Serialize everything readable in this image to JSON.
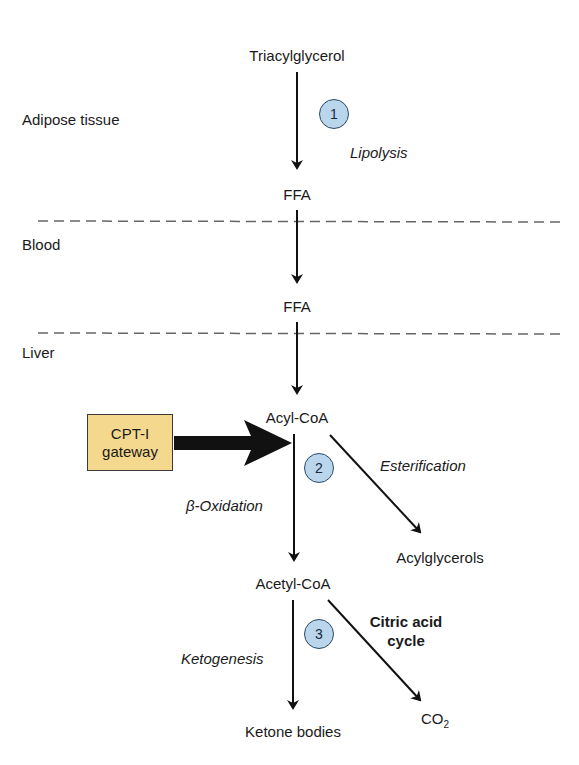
{
  "regions": {
    "adipose": "Adipose tissue",
    "blood": "Blood",
    "liver": "Liver"
  },
  "nodes": {
    "triacylglycerol": "Triacylglycerol",
    "ffa_adipose": "FFA",
    "ffa_blood": "FFA",
    "acyl_coa": "Acyl-CoA",
    "acylglycerols": "Acylglycerols",
    "acetyl_coa": "Acetyl-CoA",
    "ketone_bodies": "Ketone bodies",
    "co2_base": "CO",
    "co2_sub": "2"
  },
  "processes": {
    "lipolysis": "Lipolysis",
    "esterification": "Esterification",
    "beta_oxidation": "β-Oxidation",
    "ketogenesis": "Ketogenesis",
    "citric_line1": "Citric acid",
    "citric_line2": "cycle"
  },
  "steps": [
    "1",
    "2",
    "3"
  ],
  "gateway": {
    "line1": "CPT-I",
    "line2": "gateway"
  },
  "colors": {
    "gateway_fill": "#f4d88e",
    "step_circle_fill": "#b9d6ec",
    "arrow": "#111111",
    "divider": "#666666"
  }
}
